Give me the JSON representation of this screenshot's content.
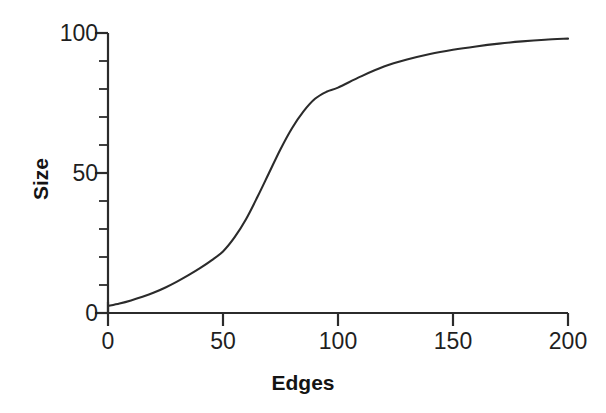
{
  "chart_data": {
    "type": "line",
    "title": "",
    "subtitle": "",
    "xlabel": "Edges",
    "ylabel": "Size",
    "xlim": [
      0,
      200
    ],
    "ylim": [
      0,
      100
    ],
    "grid": false,
    "legend": null,
    "legend_position": "none",
    "line_color": "#2b2b2b",
    "background_color": "#ffffff",
    "axis_color": "#2b2b2b",
    "x_ticks": [
      0,
      50,
      100,
      150,
      200
    ],
    "x_tick_labels": [
      "0",
      "50",
      "100",
      "150",
      "200"
    ],
    "x_minor_tick_interval": 10,
    "y_ticks": [
      0,
      50,
      100
    ],
    "y_tick_labels": [
      "0",
      "50",
      "100"
    ],
    "y_minor_tick_interval": 10,
    "series": [
      {
        "name": "Size vs Edges",
        "x": [
          0,
          5,
          10,
          15,
          20,
          25,
          30,
          35,
          40,
          45,
          50,
          55,
          60,
          65,
          70,
          75,
          80,
          85,
          90,
          95,
          100,
          110,
          120,
          130,
          140,
          150,
          160,
          170,
          180,
          190,
          200
        ],
        "values": [
          2.5,
          3.4,
          4.5,
          5.8,
          7.3,
          9.1,
          11.2,
          13.5,
          16.0,
          18.8,
          22.0,
          27.0,
          33.5,
          41.5,
          50.0,
          58.5,
          66.0,
          72.0,
          76.5,
          79.0,
          80.5,
          84.5,
          88.0,
          90.5,
          92.5,
          94.0,
          95.2,
          96.2,
          97.0,
          97.6,
          98.0
        ]
      }
    ],
    "annotations": []
  },
  "axes": {
    "y_title": "Size",
    "x_title": "Edges",
    "y_tick_labels": [
      "100",
      "50",
      "0"
    ],
    "x_tick_labels": [
      "0",
      "50",
      "100",
      "150",
      "200"
    ]
  }
}
